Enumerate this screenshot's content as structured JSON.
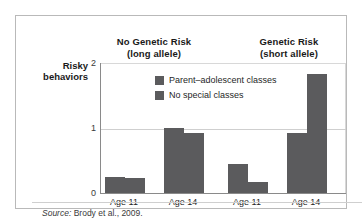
{
  "figure": {
    "source_label": "Source:",
    "source_text": " Brody et al., 2009."
  },
  "chart_data": {
    "type": "bar",
    "title": "",
    "xlabel": "",
    "ylabel": "Risky behaviors",
    "ylabel_line1": "Risky",
    "ylabel_line2": "behaviors",
    "ylim": [
      0,
      2
    ],
    "yticks": [
      "0",
      "1",
      "2"
    ],
    "ytick_2": "2",
    "ytick_1": "1",
    "ytick_0": "0",
    "grid": "horizontal-at-1",
    "legend_position": "inside-top-center",
    "panels": [
      {
        "title_line1": "No Genetic Risk",
        "title_line2": "(long allele)"
      },
      {
        "title_line1": "Genetic Risk",
        "title_line2": "(short allele)"
      }
    ],
    "categories": [
      "Age 11",
      "Age 14",
      "Age 11",
      "Age 14"
    ],
    "xtick_0": "Age 11",
    "xtick_1": "Age 14",
    "xtick_2": "Age 11",
    "xtick_3": "Age 14",
    "series": [
      {
        "name": "Parent–adolescent classes",
        "color": "#5b5b5d",
        "values": [
          0.25,
          1.0,
          0.45,
          0.91
        ]
      },
      {
        "name": "No special classes",
        "color": "#5b5b5d",
        "values": [
          0.23,
          0.91,
          0.17,
          1.82
        ]
      }
    ],
    "colors": {
      "bar": "#5b5b5d",
      "gridline": "#cfcfcf",
      "axis": "#8a8a8a",
      "frame": "#b9b9b9"
    }
  }
}
